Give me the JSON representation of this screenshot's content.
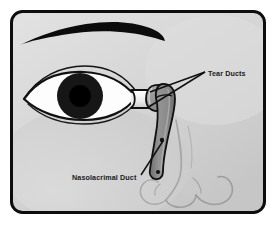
{
  "diagram": {
    "type": "anatomical-illustration",
    "frame": {
      "border_color": "#0d0d0d",
      "border_width_px": 3,
      "corner_radius_px": 12,
      "background_color": "#d6d6d6",
      "page_background": "#ffffff"
    },
    "palette": {
      "skin": "#d6d6d6",
      "skin_shadow": "#c3c3c3",
      "skin_highlight": "#e4e4e4",
      "outline": "#111111",
      "duct_fill": "#8e8e8e",
      "duct_shadow": "#6f6f6f",
      "duct_highlight": "#a8a8a8",
      "sclera": "#fdfdfd",
      "iris": "#141414",
      "pupil": "#000000",
      "eyebrow": "#0a0a0a",
      "nose_line": "#9a9a9a",
      "leader_line": "#111111",
      "label_text": "#1b1b1b"
    },
    "labels": [
      {
        "id": "tear-ducts",
        "text": "Tear Ducts",
        "x": 208,
        "y": 73,
        "anchor": "start",
        "leader_lines": 2
      },
      {
        "id": "nasolacrimal-duct",
        "text": "Nasolacrimal Duct",
        "x": 72,
        "y": 180,
        "anchor": "start",
        "leader_lines": 1
      }
    ],
    "parts": [
      {
        "id": "eyebrow",
        "name": "Eyebrow"
      },
      {
        "id": "eye",
        "name": "Eye"
      },
      {
        "id": "sclera",
        "name": "Sclera"
      },
      {
        "id": "iris",
        "name": "Iris"
      },
      {
        "id": "pupil",
        "name": "Pupil"
      },
      {
        "id": "canaliculus",
        "name": "Lacrimal Canaliculus"
      },
      {
        "id": "lacrimal-sac",
        "name": "Lacrimal Sac"
      },
      {
        "id": "nasolacrimal-duct-shape",
        "name": "Nasolacrimal Duct"
      },
      {
        "id": "nose",
        "name": "Nose"
      }
    ]
  }
}
